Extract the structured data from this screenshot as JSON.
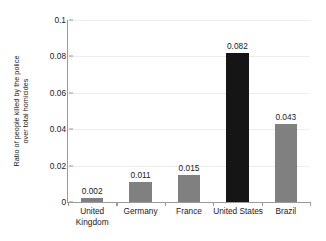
{
  "chart_data": {
    "type": "bar",
    "title": "",
    "xlabel": "",
    "ylabel": "Ratio of people killed by the police over total homicides",
    "ylabel_lines": [
      "Ratio of people killed by the police",
      "over total homicides"
    ],
    "categories": [
      "United Kingdom",
      "Germany",
      "France",
      "United States",
      "Brazil"
    ],
    "category_lines": [
      [
        "United",
        "Kingdom"
      ],
      [
        "Germany"
      ],
      [
        "France"
      ],
      [
        "United States"
      ],
      [
        "Brazil"
      ]
    ],
    "values": [
      0.002,
      0.011,
      0.015,
      0.082,
      0.043
    ],
    "value_labels": [
      "0.002",
      "0.011",
      "0.015",
      "0.082",
      "0.043"
    ],
    "ylim": [
      0,
      0.1
    ],
    "ytick_values": [
      0,
      0.02,
      0.04,
      0.06,
      0.08,
      0.1
    ],
    "ytick_labels": [
      "0",
      "0.02",
      "0.04",
      "0.06",
      "0.08",
      "0.1"
    ],
    "grid": true,
    "legend": "none",
    "bar_colors": [
      "#808080",
      "#808080",
      "#808080",
      "#151515",
      "#808080"
    ],
    "highlight_category": "United States",
    "colors": {
      "bar_default": "#808080",
      "bar_highlight": "#151515",
      "axis": "#9a9a9a",
      "grid": "#ededed",
      "text": "#1a1a1a",
      "background": "#ffffff"
    }
  }
}
